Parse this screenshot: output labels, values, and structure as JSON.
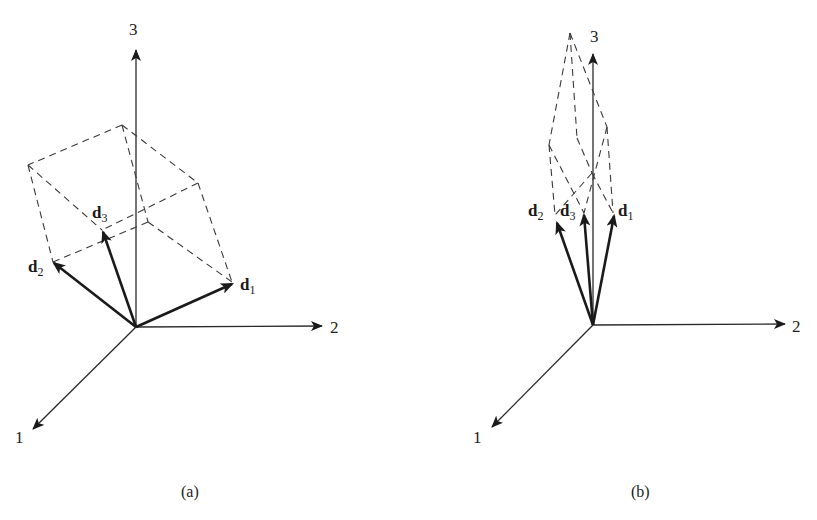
{
  "panels": [
    {
      "id": "a",
      "caption": "(a)",
      "axes": {
        "x1_label": "1",
        "x2_label": "2",
        "x3_label": "3"
      },
      "vectors": [
        {
          "name": "d",
          "sub": "1"
        },
        {
          "name": "d",
          "sub": "2"
        },
        {
          "name": "d",
          "sub": "3"
        }
      ],
      "description": "Three nearly orthogonal basis vectors d1, d2, d3 spanning a well-shaped parallelepiped (dashed)"
    },
    {
      "id": "b",
      "caption": "(b)",
      "axes": {
        "x1_label": "1",
        "x2_label": "2",
        "x3_label": "3"
      },
      "vectors": [
        {
          "name": "d",
          "sub": "1"
        },
        {
          "name": "d",
          "sub": "2"
        },
        {
          "name": "d",
          "sub": "3"
        }
      ],
      "description": "Three nearly parallel vectors d1, d2, d3 clustered around axis 3 spanning a thin, elongated parallelepiped (dashed)"
    }
  ],
  "colors": {
    "ink": "#1a1a1a",
    "background": "#ffffff"
  }
}
